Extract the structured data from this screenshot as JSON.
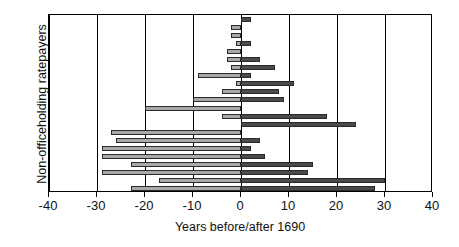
{
  "chart_data": {
    "type": "bar",
    "orientation": "horizontal",
    "subtype": "floating-range-bar",
    "title": "",
    "xlabel": "Years before/after 1690",
    "ylabel": "Non-officeholding ratepayers",
    "xlim": [
      -40,
      40
    ],
    "xticks": [
      -40,
      -30,
      -20,
      -10,
      0,
      10,
      20,
      30,
      40
    ],
    "xtick_labels": [
      "-40",
      "-30",
      "-20",
      "-10",
      "0",
      "10",
      "20",
      "30",
      "40"
    ],
    "ytick_labels": [],
    "grid": "vertical gridlines at every x tick",
    "legend": "none",
    "colors": {
      "negative_segment": "#a8a8a8",
      "positive_segment": "#4a4a4a",
      "bar_outline": "#2b2b2b",
      "axis": "#000000",
      "background": "#ffffff"
    },
    "note": "Each row is one ratepayer: bar spans from first year before 1690 (negative start) to last year after 1690 (positive end).",
    "categories": [
      "r1",
      "r2",
      "r3",
      "r4",
      "r5",
      "r6",
      "r7",
      "r8",
      "r9",
      "r10",
      "r11",
      "r12",
      "r13",
      "r14",
      "r15",
      "r16",
      "r17",
      "r18",
      "r19",
      "r20",
      "r21",
      "r22"
    ],
    "series": [
      {
        "name": "start (years before 1690)",
        "values": [
          0,
          -2,
          -2,
          -1,
          -3,
          -3,
          -2,
          -9,
          -1,
          -4,
          -10,
          -20,
          -4,
          0,
          -27,
          -26,
          -29,
          -29,
          -23,
          -29,
          -17,
          -23
        ]
      },
      {
        "name": "end (years after 1690)",
        "values": [
          2,
          0,
          0,
          2,
          0,
          4,
          7,
          2,
          11,
          8,
          9,
          0,
          18,
          24,
          0,
          4,
          2,
          5,
          15,
          14,
          30,
          28
        ]
      }
    ],
    "bars": [
      {
        "start": 0,
        "end": 2
      },
      {
        "start": -2,
        "end": 0
      },
      {
        "start": -2,
        "end": 0
      },
      {
        "start": -1,
        "end": 2
      },
      {
        "start": -3,
        "end": 0
      },
      {
        "start": -3,
        "end": 4
      },
      {
        "start": -2,
        "end": 7
      },
      {
        "start": -9,
        "end": 2
      },
      {
        "start": -1,
        "end": 11
      },
      {
        "start": -4,
        "end": 8
      },
      {
        "start": -10,
        "end": 9
      },
      {
        "start": -20,
        "end": 0
      },
      {
        "start": -4,
        "end": 18
      },
      {
        "start": 0,
        "end": 24
      },
      {
        "start": -27,
        "end": 0
      },
      {
        "start": -26,
        "end": 4
      },
      {
        "start": -29,
        "end": 2
      },
      {
        "start": -29,
        "end": 5
      },
      {
        "start": -23,
        "end": 15
      },
      {
        "start": -29,
        "end": 14
      },
      {
        "start": -17,
        "end": 30
      },
      {
        "start": -23,
        "end": 28
      }
    ]
  }
}
